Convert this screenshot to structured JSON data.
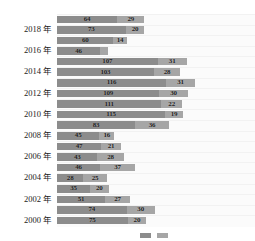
{
  "chart_data": {
    "type": "bar",
    "title": "",
    "subtitle": "",
    "xlabel": "",
    "ylabel": "",
    "orientation": "horizontal",
    "stacked": true,
    "grid": true,
    "legend_position": "bottom-right",
    "xlim": [
      0,
      150
    ],
    "categories": [
      "2019",
      "2018",
      "2017",
      "2016",
      "2015",
      "2014",
      "2013",
      "2012",
      "2011",
      "2010",
      "2009",
      "2008",
      "2007",
      "2006",
      "2005",
      "2004",
      "2003",
      "2002",
      "2001",
      "2000"
    ],
    "tick_labels": [
      "2018 年",
      "2016 年",
      "2014 年",
      "2012 年",
      "2010 年",
      "2008 年",
      "2006 年",
      "2004 年",
      "2002 年",
      "2000 年"
    ],
    "series": [
      {
        "name": "series-1",
        "color": "#8c8c8c",
        "values": [
          64,
          73,
          60,
          46,
          107,
          103,
          116,
          109,
          111,
          115,
          83,
          45,
          47,
          43,
          46,
          28,
          35,
          51,
          74,
          75
        ]
      },
      {
        "name": "series-2",
        "color": "#a6a6a6",
        "values": [
          29,
          20,
          14,
          8,
          31,
          28,
          31,
          30,
          22,
          19,
          36,
          16,
          21,
          28,
          37,
          25,
          20,
          27,
          30,
          20
        ]
      }
    ],
    "rows": [
      {
        "category": "2019",
        "tick": "",
        "v1": 64,
        "v2": 29,
        "l1": "64",
        "l2": "29"
      },
      {
        "category": "2018",
        "tick": "2018 年",
        "v1": 73,
        "v2": 20,
        "l1": "73",
        "l2": "20"
      },
      {
        "category": "2017",
        "tick": "",
        "v1": 60,
        "v2": 14,
        "l1": "60",
        "l2": "14"
      },
      {
        "category": "2016",
        "tick": "2016 年",
        "v1": 46,
        "v2": 8,
        "l1": "46",
        "l2": ""
      },
      {
        "category": "2015",
        "tick": "",
        "v1": 107,
        "v2": 31,
        "l1": "107",
        "l2": "31"
      },
      {
        "category": "2014",
        "tick": "2014 年",
        "v1": 103,
        "v2": 28,
        "l1": "103",
        "l2": "28"
      },
      {
        "category": "2013",
        "tick": "",
        "v1": 116,
        "v2": 31,
        "l1": "116",
        "l2": "31"
      },
      {
        "category": "2012",
        "tick": "2012 年",
        "v1": 109,
        "v2": 30,
        "l1": "109",
        "l2": "30"
      },
      {
        "category": "2011",
        "tick": "",
        "v1": 111,
        "v2": 22,
        "l1": "111",
        "l2": "22"
      },
      {
        "category": "2010",
        "tick": "2010 年",
        "v1": 115,
        "v2": 19,
        "l1": "115",
        "l2": "19"
      },
      {
        "category": "2009",
        "tick": "",
        "v1": 83,
        "v2": 36,
        "l1": "83",
        "l2": "36"
      },
      {
        "category": "2008",
        "tick": "2008 年",
        "v1": 45,
        "v2": 16,
        "l1": "45",
        "l2": "16"
      },
      {
        "category": "2007",
        "tick": "",
        "v1": 47,
        "v2": 21,
        "l1": "47",
        "l2": "21"
      },
      {
        "category": "2006",
        "tick": "2006 年",
        "v1": 43,
        "v2": 28,
        "l1": "43",
        "l2": "28"
      },
      {
        "category": "2005",
        "tick": "",
        "v1": 46,
        "v2": 37,
        "l1": "46",
        "l2": "37"
      },
      {
        "category": "2004",
        "tick": "2004 年",
        "v1": 28,
        "v2": 25,
        "l1": "28",
        "l2": "25"
      },
      {
        "category": "2003",
        "tick": "",
        "v1": 35,
        "v2": 20,
        "l1": "35",
        "l2": "20"
      },
      {
        "category": "2002",
        "tick": "2002 年",
        "v1": 51,
        "v2": 27,
        "l1": "51",
        "l2": "27"
      },
      {
        "category": "2001",
        "tick": "",
        "v1": 74,
        "v2": 30,
        "l1": "74",
        "l2": "30"
      },
      {
        "category": "2000",
        "tick": "2000 年",
        "v1": 75,
        "v2": 20,
        "l1": "75",
        "l2": "20"
      }
    ],
    "scale_px_per_unit": 0.94,
    "bar_origin_px": 57
  },
  "legend": {
    "items": [
      {
        "label": "",
        "color": "#8c8c8c"
      },
      {
        "label": "",
        "color": "#a6a6a6"
      }
    ]
  }
}
